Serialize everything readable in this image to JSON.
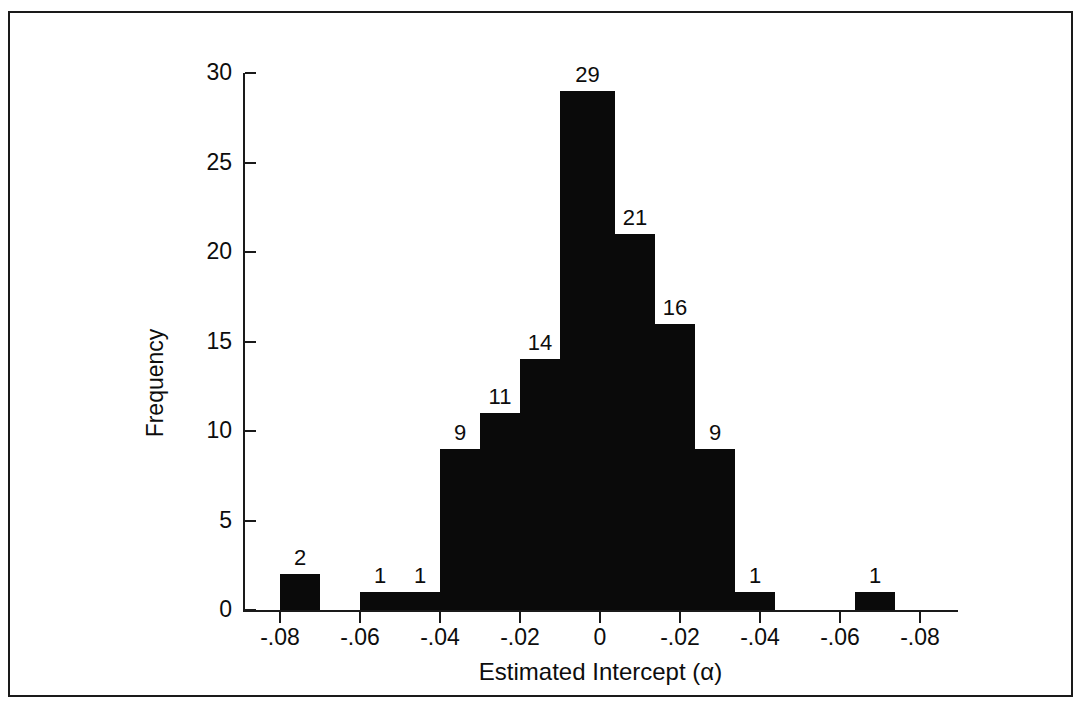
{
  "chart_data": {
    "type": "bar",
    "title": "",
    "subtitle": "",
    "xlabel": "Estimated Intercept (α)",
    "ylabel": "Frequency",
    "grid": false,
    "legend": null,
    "ylim": [
      0,
      30
    ],
    "y_ticks": [
      0,
      5,
      10,
      15,
      20,
      25,
      30
    ],
    "y_tick_labels": [
      "0",
      "5",
      "10",
      "15",
      "20",
      "25",
      "30"
    ],
    "x_tick_labels": [
      "-.08",
      "-.06",
      "-.04",
      "-.02",
      "0",
      "-.02",
      "-.04",
      "-.06",
      "-.08"
    ],
    "x_tick_positions_px": [
      270,
      350,
      430,
      510,
      590,
      670,
      750,
      830,
      910
    ],
    "categories": [
      "bin1",
      "bin2",
      "bin3",
      "bin4",
      "bin5",
      "bin6",
      "bin7",
      "bin8",
      "bin9",
      "bin10",
      "bin11",
      "bin12",
      "bin13",
      "bin14",
      "bin15",
      "bin16",
      "bin17"
    ],
    "values": [
      2,
      0,
      0,
      1,
      1,
      9,
      11,
      14,
      29,
      21,
      16,
      9,
      1,
      0,
      0,
      1,
      0
    ],
    "bar_labels": [
      "2",
      "",
      "",
      "1",
      "1",
      "9",
      "11",
      "14",
      "29",
      "21",
      "16",
      "9",
      "1",
      "",
      "",
      "1",
      ""
    ],
    "bars": [
      {
        "name": "bar-2",
        "value": 2,
        "label": "2",
        "x": 270,
        "width": 40,
        "show_label": true
      },
      {
        "name": "bar-0a",
        "value": 0,
        "label": "",
        "x": 310,
        "width": 40,
        "show_label": false
      },
      {
        "name": "bar-0b",
        "value": 0,
        "label": "",
        "x": 350,
        "width": 0,
        "show_label": false
      },
      {
        "name": "bar-1a",
        "value": 1,
        "label": "1",
        "x": 350,
        "width": 40,
        "show_label": true
      },
      {
        "name": "bar-1b",
        "value": 1,
        "label": "1",
        "x": 390,
        "width": 40,
        "show_label": true
      },
      {
        "name": "bar-9a",
        "value": 9,
        "label": "9",
        "x": 430,
        "width": 40,
        "show_label": true
      },
      {
        "name": "bar-11",
        "value": 11,
        "label": "11",
        "x": 470,
        "width": 40,
        "show_label": true
      },
      {
        "name": "bar-14",
        "value": 14,
        "label": "14",
        "x": 510,
        "width": 40,
        "show_label": true
      },
      {
        "name": "bar-29",
        "value": 29,
        "label": "29",
        "x": 550,
        "width": 55,
        "show_label": true
      },
      {
        "name": "bar-21",
        "value": 21,
        "label": "21",
        "x": 605,
        "width": 40,
        "show_label": true
      },
      {
        "name": "bar-16",
        "value": 16,
        "label": "16",
        "x": 645,
        "width": 40,
        "show_label": true
      },
      {
        "name": "bar-9b",
        "value": 9,
        "label": "9",
        "x": 685,
        "width": 40,
        "show_label": true
      },
      {
        "name": "bar-1c",
        "value": 1,
        "label": "1",
        "x": 725,
        "width": 40,
        "show_label": true
      },
      {
        "name": "bar-1d",
        "value": 1,
        "label": "1",
        "x": 845,
        "width": 40,
        "show_label": true
      }
    ]
  },
  "axes": {
    "y_axis_name": "y-axis",
    "x_axis_name": "x-axis"
  }
}
